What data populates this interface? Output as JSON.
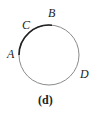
{
  "figure": {
    "caption": "(d)",
    "circle": {
      "cx": 49,
      "cy": 55,
      "r": 30,
      "stroke": "#8a8a8a"
    },
    "highlighted_arc": {
      "from": "A",
      "to": "B",
      "via": "C",
      "stroke": "#222222"
    },
    "points": [
      {
        "label": "A",
        "x": 7,
        "y": 58
      },
      {
        "label": "B",
        "x": 48,
        "y": 17
      },
      {
        "label": "C",
        "x": 22,
        "y": 29
      },
      {
        "label": "D",
        "x": 80,
        "y": 78
      }
    ]
  }
}
